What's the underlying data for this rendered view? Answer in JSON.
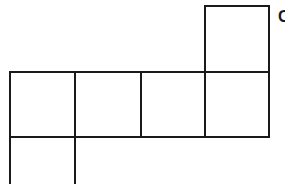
{
  "diagram": {
    "type": "cube-net",
    "cell_size": 65,
    "line_color": "#1a1a1a",
    "background": "#ffffff",
    "cells": [
      {
        "row": 0,
        "col": 3
      },
      {
        "row": 1,
        "col": 0
      },
      {
        "row": 1,
        "col": 1
      },
      {
        "row": 1,
        "col": 2
      },
      {
        "row": 1,
        "col": 3
      },
      {
        "row": 2,
        "col": 0
      }
    ],
    "label": "C"
  }
}
